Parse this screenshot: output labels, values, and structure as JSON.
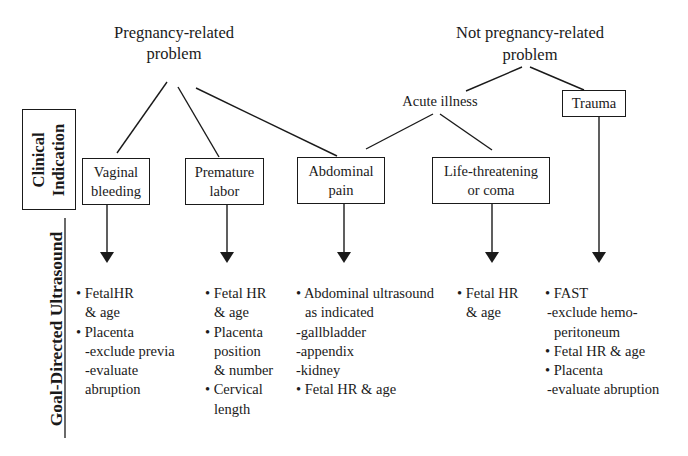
{
  "diagram": {
    "left_labels": {
      "clinical_indication": [
        "Clinical",
        "Indication"
      ],
      "goal_directed": "Goal-Directed Ultrasound"
    },
    "roots": {
      "pregnancy": [
        "Pregnancy-related",
        "problem"
      ],
      "not_pregnancy": [
        "Not pregnancy-related",
        "problem"
      ]
    },
    "intermediate": {
      "acute_illness": "Acute illness",
      "trauma": "Trauma"
    },
    "indications": [
      {
        "id": "vaginal-bleeding",
        "lines": [
          "Vaginal",
          "bleeding"
        ]
      },
      {
        "id": "premature-labor",
        "lines": [
          "Premature",
          "labor"
        ]
      },
      {
        "id": "abdominal-pain",
        "lines": [
          "Abdominal",
          "pain"
        ]
      },
      {
        "id": "life-threatening",
        "lines": [
          "Life-threatening",
          "or coma"
        ]
      }
    ],
    "ultrasound_goals": {
      "vaginal_bleeding": [
        "• FetalHR",
        "& age",
        "• Placenta",
        "-exclude previa",
        "-evaluate",
        "abruption"
      ],
      "premature_labor": [
        "• Fetal HR",
        "& age",
        "• Placenta",
        "position",
        "& number",
        "• Cervical",
        "length"
      ],
      "abdominal_pain": [
        "• Abdominal ultrasound",
        "as indicated",
        "-gallbladder",
        "-appendix",
        "-kidney",
        "• Fetal HR & age"
      ],
      "life_threatening": [
        "• Fetal HR",
        "& age"
      ],
      "trauma": [
        "• FAST",
        "-exclude hemo-",
        "peritoneum",
        "• Fetal HR & age",
        "• Placenta",
        "-evaluate abruption"
      ]
    },
    "colors": {
      "line": "#1a1a1a",
      "background": "#ffffff"
    }
  }
}
